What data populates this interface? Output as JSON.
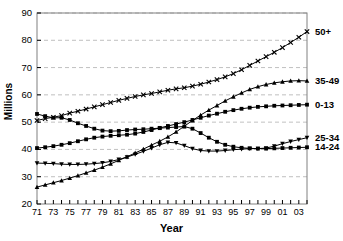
{
  "chart_data": {
    "type": "line",
    "title": "",
    "xlabel": "Year",
    "ylabel": "Millions",
    "xlim": [
      1971,
      2004
    ],
    "ylim": [
      20,
      90
    ],
    "ytick_step": 10,
    "grid": true,
    "legend_position": "right-edge-labels",
    "axis_color": "#808080",
    "grid_color": "#b0b0b0",
    "series_color": "#000000",
    "yticks": [
      "20",
      "30",
      "40",
      "50",
      "60",
      "70",
      "80",
      "90"
    ],
    "xticks": [
      "71",
      "73",
      "75",
      "77",
      "79",
      "81",
      "83",
      "85",
      "87",
      "89",
      "91",
      "93",
      "95",
      "97",
      "99",
      "01",
      "03"
    ],
    "x": [
      1971,
      1972,
      1973,
      1974,
      1975,
      1976,
      1977,
      1978,
      1979,
      1980,
      1981,
      1982,
      1983,
      1984,
      1985,
      1986,
      1987,
      1988,
      1989,
      1990,
      1991,
      1992,
      1993,
      1994,
      1995,
      1996,
      1997,
      1998,
      1999,
      2000,
      2001,
      2002,
      2003,
      2004
    ],
    "series": [
      {
        "name": "50+",
        "label": "50+",
        "marker": "x",
        "values": [
          50.6,
          51.3,
          51.8,
          52.4,
          53.3,
          54.0,
          54.8,
          55.6,
          56.4,
          57.2,
          58.0,
          58.7,
          59.4,
          60.0,
          60.5,
          61.1,
          61.7,
          62.2,
          62.6,
          63.2,
          63.9,
          64.7,
          65.6,
          66.6,
          67.8,
          69.2,
          70.8,
          72.4,
          74.0,
          75.6,
          77.3,
          79.2,
          81.1,
          83.2
        ]
      },
      {
        "name": "35-49",
        "label": "35-49",
        "marker": "triangle-up",
        "values": [
          26.2,
          27.0,
          27.8,
          28.6,
          29.5,
          30.4,
          31.4,
          32.4,
          33.5,
          34.7,
          36.0,
          37.3,
          38.7,
          40.1,
          41.6,
          43.0,
          44.6,
          46.4,
          48.5,
          50.6,
          52.6,
          54.4,
          56.1,
          57.8,
          59.3,
          60.7,
          62.0,
          63.0,
          63.8,
          64.4,
          64.8,
          65.1,
          65.2,
          65.1
        ]
      },
      {
        "name": "0-13",
        "label": "0-13",
        "marker": "square",
        "values": [
          40.5,
          40.8,
          41.2,
          41.7,
          42.3,
          43.0,
          43.7,
          44.3,
          44.7,
          45.0,
          45.2,
          45.4,
          45.8,
          46.4,
          47.1,
          47.9,
          48.6,
          49.3,
          50.0,
          50.8,
          51.6,
          52.4,
          53.1,
          53.8,
          54.4,
          54.9,
          55.3,
          55.6,
          55.8,
          56.0,
          56.1,
          56.2,
          56.3,
          56.4
        ]
      },
      {
        "name": "14-24",
        "label": "14-24",
        "marker": "square",
        "values": [
          53.0,
          52.2,
          51.6,
          51.6,
          50.8,
          49.6,
          48.6,
          47.6,
          46.9,
          46.7,
          46.8,
          47.1,
          47.3,
          47.4,
          47.6,
          47.8,
          48.0,
          48.2,
          48.4,
          47.6,
          46.0,
          44.3,
          42.8,
          41.7,
          41.0,
          40.6,
          40.4,
          40.3,
          40.3,
          40.4,
          40.5,
          40.6,
          40.7,
          40.8
        ]
      },
      {
        "name": "25-34",
        "label": "25-34",
        "marker": "triangle-down",
        "values": [
          35.0,
          34.9,
          34.8,
          34.6,
          34.5,
          34.5,
          34.6,
          34.8,
          35.1,
          35.6,
          36.3,
          37.2,
          38.2,
          39.3,
          40.5,
          41.7,
          42.6,
          42.4,
          41.4,
          40.3,
          39.6,
          39.4,
          39.4,
          39.6,
          39.9,
          40.1,
          40.3,
          40.3,
          40.5,
          41.2,
          42.1,
          42.9,
          43.6,
          44.3
        ]
      }
    ]
  }
}
